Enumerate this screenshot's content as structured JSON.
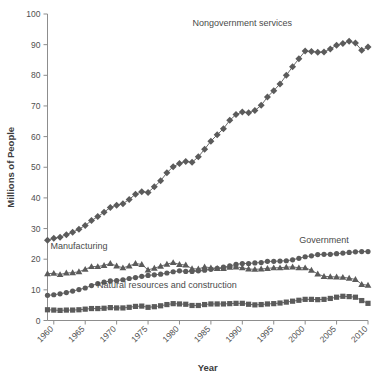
{
  "chart_data": {
    "type": "line",
    "title": "",
    "xlabel": "Year",
    "ylabel": "Millions of People",
    "xlim": [
      1959,
      2010
    ],
    "ylim": [
      0,
      100
    ],
    "grid": false,
    "legend_position": "inline-annotations",
    "xticks": [
      "1960",
      "1965",
      "1970",
      "1975",
      "1980",
      "1985",
      "1990",
      "1995",
      "2000",
      "2005",
      "2010"
    ],
    "xtick_values": [
      1960,
      1965,
      1970,
      1975,
      1980,
      1985,
      1990,
      1995,
      2000,
      2005,
      2010
    ],
    "yticks": [
      "0",
      "10",
      "20",
      "30",
      "40",
      "50",
      "60",
      "70",
      "80",
      "90",
      "100"
    ],
    "ytick_values": [
      0,
      10,
      20,
      30,
      40,
      50,
      60,
      70,
      80,
      90,
      100
    ],
    "x": [
      1959,
      1960,
      1961,
      1962,
      1963,
      1964,
      1965,
      1966,
      1967,
      1968,
      1969,
      1970,
      1971,
      1972,
      1973,
      1974,
      1975,
      1976,
      1977,
      1978,
      1979,
      1980,
      1981,
      1982,
      1983,
      1984,
      1985,
      1986,
      1987,
      1988,
      1989,
      1990,
      1991,
      1992,
      1993,
      1994,
      1995,
      1996,
      1997,
      1998,
      1999,
      2000,
      2001,
      2002,
      2003,
      2004,
      2005,
      2006,
      2007,
      2008,
      2009,
      2010
    ],
    "series": [
      {
        "name": "Nongovernment services",
        "marker": "diamond",
        "color": "#5b5b5b",
        "label_x": 1990,
        "label_y": 96,
        "values": [
          26.2,
          26.8,
          27.2,
          28.0,
          28.8,
          29.8,
          31.0,
          32.6,
          33.9,
          35.3,
          36.9,
          37.6,
          38.1,
          39.5,
          41.2,
          42.0,
          41.8,
          43.6,
          45.6,
          48.2,
          50.2,
          51.2,
          51.9,
          51.6,
          53.4,
          55.9,
          58.5,
          60.6,
          62.6,
          65.3,
          67.2,
          68.0,
          67.8,
          68.5,
          70.2,
          72.9,
          75.0,
          77.2,
          80.0,
          82.8,
          85.4,
          87.9,
          87.8,
          87.5,
          87.6,
          88.6,
          89.8,
          90.4,
          91.1,
          90.5,
          88.2,
          89.2
        ]
      },
      {
        "name": "Manufacturing",
        "marker": "triangle",
        "color": "#5b5b5b",
        "label_x": 1964,
        "label_y": 23.4,
        "values": [
          15.3,
          15.4,
          15.0,
          15.5,
          15.6,
          15.9,
          16.7,
          17.6,
          17.6,
          18.0,
          18.6,
          17.8,
          17.2,
          17.8,
          18.6,
          18.3,
          16.5,
          17.1,
          17.7,
          18.4,
          18.9,
          18.3,
          18.1,
          16.9,
          16.8,
          17.5,
          17.2,
          17.0,
          17.0,
          17.4,
          17.5,
          17.2,
          16.8,
          16.7,
          16.8,
          17.0,
          17.2,
          17.2,
          17.4,
          17.5,
          17.2,
          17.2,
          16.4,
          15.2,
          14.4,
          14.3,
          14.2,
          14.1,
          13.8,
          13.4,
          11.8,
          11.5
        ]
      },
      {
        "name": "Government",
        "marker": "circle",
        "color": "#5b5b5b",
        "label_x": 2003,
        "label_y": 25.3,
        "values": [
          8.2,
          8.4,
          8.7,
          9.1,
          9.6,
          10.1,
          10.6,
          11.4,
          12.0,
          12.5,
          12.9,
          13.0,
          13.3,
          13.7,
          14.0,
          14.4,
          14.7,
          14.9,
          15.1,
          15.5,
          15.9,
          16.2,
          16.0,
          16.0,
          16.2,
          16.4,
          16.7,
          17.0,
          17.4,
          17.8,
          18.3,
          18.6,
          18.6,
          18.8,
          18.9,
          19.3,
          19.3,
          19.4,
          19.5,
          19.8,
          20.3,
          20.8,
          21.1,
          21.5,
          21.6,
          21.6,
          21.8,
          22.0,
          22.2,
          22.4,
          22.5,
          22.5
        ]
      },
      {
        "name": "Natural resources and construction",
        "marker": "square",
        "color": "#5b5b5b",
        "label_x": 1978,
        "label_y": 10.6,
        "values": [
          3.5,
          3.4,
          3.3,
          3.4,
          3.4,
          3.5,
          3.7,
          3.9,
          3.9,
          4.0,
          4.2,
          4.1,
          4.1,
          4.3,
          4.6,
          4.7,
          4.3,
          4.5,
          4.8,
          5.2,
          5.5,
          5.4,
          5.3,
          4.9,
          4.9,
          5.2,
          5.4,
          5.4,
          5.4,
          5.5,
          5.6,
          5.6,
          5.3,
          5.1,
          5.2,
          5.4,
          5.5,
          5.7,
          6.0,
          6.3,
          6.6,
          6.9,
          6.9,
          6.8,
          6.9,
          7.2,
          7.6,
          7.9,
          7.8,
          7.6,
          6.5,
          5.6
        ]
      }
    ]
  }
}
